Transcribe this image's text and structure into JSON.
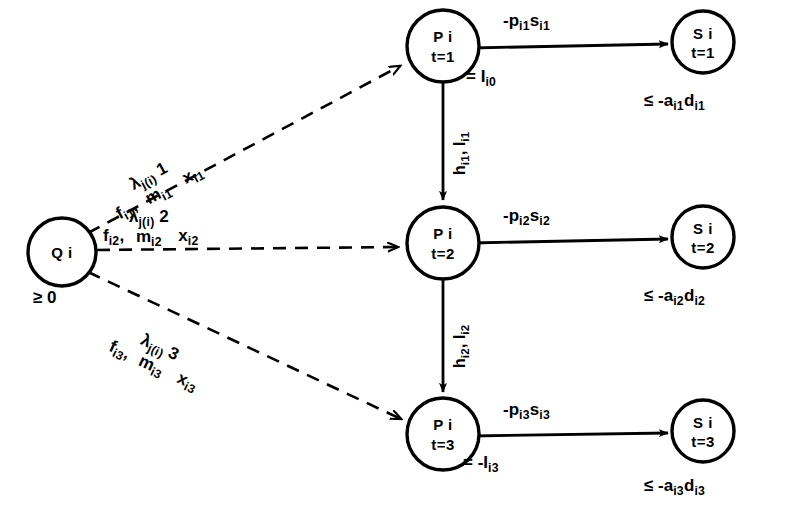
{
  "figure": {
    "type": "network-flow-diagram",
    "background": "#ffffff",
    "ink": "#000000"
  },
  "nodes": {
    "source": {
      "id": "Q",
      "line1": "Q i",
      "below": "≥ 0",
      "cx": 62,
      "cy": 252,
      "r": 34
    },
    "plants": [
      {
        "line1": "P i",
        "line2": "t=1",
        "annotation": "= I",
        "annotation_sub": "i0",
        "cx": 443,
        "cy": 46,
        "r": 36
      },
      {
        "line1": "P i",
        "line2": "t=2",
        "annotation": "",
        "annotation_sub": "",
        "cx": 443,
        "cy": 243,
        "r": 36
      },
      {
        "line1": "P i",
        "line2": "t=3",
        "annotation": "= -I",
        "annotation_sub": "i3",
        "cx": 443,
        "cy": 434,
        "r": 36
      }
    ],
    "sinks": [
      {
        "line1": "S i",
        "line2": "t=1",
        "below_prefix": "≤ -a",
        "below_sub1": "i1",
        "below_mid": "d",
        "below_sub2": "i1",
        "cx": 703,
        "cy": 42,
        "r": 31
      },
      {
        "line1": "S i",
        "line2": "t=2",
        "below_prefix": "≤ -a",
        "below_sub1": "i2",
        "below_mid": "d",
        "below_sub2": "i2",
        "cx": 703,
        "cy": 237,
        "r": 31
      },
      {
        "line1": "S i",
        "line2": "t=3",
        "below_prefix": "≤ -a",
        "below_sub1": "i3",
        "below_mid": "d",
        "below_sub2": "i3",
        "cx": 703,
        "cy": 431,
        "r": 31
      }
    ]
  },
  "edges": {
    "supply_arcs": [
      {
        "style": "dashed",
        "from": "Q i",
        "to": "P i t=1",
        "cost": "f",
        "cost_sub": "i1",
        "cost_sep": ",",
        "lambda": "λ",
        "lambda_sub": "j(i)",
        "period": "1",
        "denominator": "m",
        "denominator_sub": "i1",
        "flow": "x",
        "flow_sub": "i1"
      },
      {
        "style": "dashed",
        "from": "Q i",
        "to": "P i t=2",
        "cost": "f",
        "cost_sub": "i2",
        "cost_sep": ",",
        "lambda": "λ",
        "lambda_sub": "j(i)",
        "period": "2",
        "denominator": "m",
        "denominator_sub": "i2",
        "flow": "x",
        "flow_sub": "i2"
      },
      {
        "style": "dashed",
        "from": "Q i",
        "to": "P i t=3",
        "cost": "f",
        "cost_sub": "i3",
        "cost_sep": ",",
        "lambda": "λ",
        "lambda_sub": "j(i)",
        "period": "3",
        "denominator": "m",
        "denominator_sub": "i3",
        "flow": "x",
        "flow_sub": "i3"
      }
    ],
    "inventory_arcs": [
      {
        "style": "solid",
        "from": "P i t=1",
        "to": "P i t=2",
        "cost": "h",
        "cost_sub": "i1",
        "cost_sep": ",",
        "flow": "I",
        "flow_sub": "i1"
      },
      {
        "style": "solid",
        "from": "P i t=2",
        "to": "P i t=3",
        "cost": "h",
        "cost_sub": "i2",
        "cost_sep": ",",
        "flow": "I",
        "flow_sub": "i2"
      }
    ],
    "sales_arcs": [
      {
        "style": "solid",
        "from": "P i t=1",
        "to": "S i t=1",
        "price": "-p",
        "price_sub": "i1",
        "flow": "s",
        "flow_sub": "i1"
      },
      {
        "style": "solid",
        "from": "P i t=2",
        "to": "S i t=2",
        "price": "-p",
        "price_sub": "i2",
        "flow": "s",
        "flow_sub": "i2"
      },
      {
        "style": "solid",
        "from": "P i t=3",
        "to": "S i t=3",
        "price": "-p",
        "price_sub": "i3",
        "flow": "s",
        "flow_sub": "i3"
      }
    ]
  }
}
